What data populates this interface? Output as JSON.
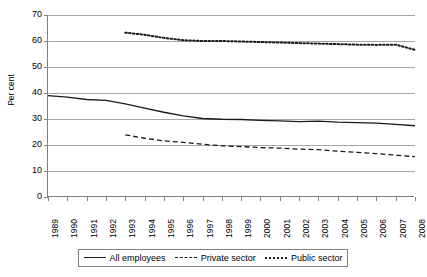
{
  "chart_data": {
    "type": "line",
    "title": "",
    "xlabel": "",
    "ylabel": "Per cent",
    "ylim": [
      0,
      70
    ],
    "ytick_step": 10,
    "yticks": [
      70,
      60,
      50,
      40,
      30,
      20,
      10,
      0
    ],
    "grid": true,
    "legend_position": "bottom",
    "categories": [
      "1989",
      "1990",
      "1991",
      "1992",
      "1993",
      "1994",
      "1995",
      "1996",
      "1997",
      "1998",
      "1999",
      "2000",
      "2001",
      "2002",
      "2003",
      "2004",
      "2005",
      "2006",
      "2007",
      "2008"
    ],
    "series": [
      {
        "name": "All employees",
        "style": "solid",
        "color": "#1a1a1a",
        "values": [
          39.0,
          38.4,
          37.5,
          37.2,
          35.8,
          34.2,
          32.6,
          31.2,
          30.2,
          29.9,
          29.8,
          29.5,
          29.3,
          29.0,
          29.2,
          28.8,
          28.6,
          28.4,
          27.9,
          27.4
        ]
      },
      {
        "name": "Private sector",
        "style": "dashed",
        "color": "#1a1a1a",
        "values": [
          null,
          null,
          null,
          null,
          23.9,
          22.6,
          21.6,
          21.0,
          20.3,
          19.7,
          19.4,
          19.0,
          18.8,
          18.4,
          18.2,
          17.6,
          17.2,
          16.7,
          16.1,
          15.5
        ]
      },
      {
        "name": "Public sector",
        "style": "dotted",
        "color": "#1a1a1a",
        "values": [
          null,
          null,
          null,
          null,
          63.2,
          62.4,
          61.2,
          60.3,
          60.0,
          60.0,
          59.8,
          59.6,
          59.4,
          59.2,
          59.0,
          58.8,
          58.6,
          58.5,
          58.6,
          56.6
        ]
      }
    ]
  },
  "legend": {
    "items": [
      {
        "label": "All employees",
        "style": "solid"
      },
      {
        "label": "Private sector",
        "style": "dashed"
      },
      {
        "label": "Public sector",
        "style": "dotted"
      }
    ]
  }
}
